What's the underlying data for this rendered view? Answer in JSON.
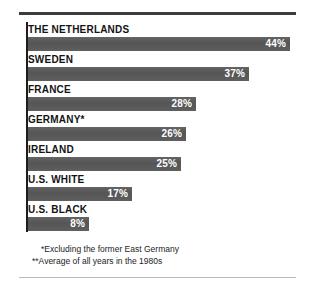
{
  "chart_data": {
    "type": "bar",
    "orientation": "horizontal",
    "title": "",
    "subtitle": "",
    "xlabel": "",
    "ylabel": "",
    "grid": false,
    "legend": null,
    "value_suffix": "%",
    "xlim": [
      0,
      44
    ],
    "categories": [
      "THE NETHERLANDS",
      "SWEDEN",
      "FRANCE",
      "GERMANY*",
      "IRELAND",
      "U.S. WHITE",
      "U.S. BLACK"
    ],
    "values": [
      44,
      37,
      28,
      26,
      25,
      17,
      8
    ],
    "value_labels": [
      "44%",
      "37%",
      "28%",
      "26%",
      "25%",
      "17%",
      "8%"
    ],
    "bar_pixel_widths": [
      262,
      221,
      168,
      158,
      153,
      104,
      61
    ],
    "annotations": [
      "*Excluding the former East Germany",
      "**Average of all years in the 1980s"
    ],
    "colors": {
      "bar": "#5a5a5a",
      "value_text": "#ffffff",
      "label_text": "#141414",
      "axis": "#1d1d1d",
      "rule_top": "#3c3c3c",
      "rule_bottom": "#b9b9b9",
      "background": "#ffffff"
    }
  },
  "rows": [
    {
      "label": "THE NETHERLANDS",
      "value_label": "44%",
      "width": "262px"
    },
    {
      "label": "SWEDEN",
      "value_label": "37%",
      "width": "221px"
    },
    {
      "label": "FRANCE",
      "value_label": "28%",
      "width": "168px"
    },
    {
      "label": "GERMANY*",
      "value_label": "26%",
      "width": "158px"
    },
    {
      "label": "IRELAND",
      "value_label": "25%",
      "width": "153px"
    },
    {
      "label": "U.S. WHITE",
      "value_label": "17%",
      "width": "104px"
    },
    {
      "label": "U.S. BLACK",
      "value_label": "8%",
      "width": "61px"
    }
  ],
  "footnotes": {
    "note_1": "*Excluding the former East Germany",
    "note_2": "**Average of all years in the 1980s"
  }
}
